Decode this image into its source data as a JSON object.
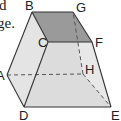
{
  "text_fragments": {
    "line1": "d",
    "line2": "ge."
  },
  "diagram": {
    "type": "solid-geometry",
    "colors": {
      "top_face": "#9a9a9a",
      "side_face_light": "#e6e6e6",
      "side_face_mid": "#dcdcdc",
      "edge": "#3a3a3a"
    },
    "vertices": {
      "A": {
        "label": "A",
        "x": 7,
        "y": 75
      },
      "B": {
        "label": "B",
        "x": 32,
        "y": 12
      },
      "C": {
        "label": "C",
        "x": 48,
        "y": 42
      },
      "D": {
        "label": "D",
        "x": 24,
        "y": 107
      },
      "E": {
        "label": "E",
        "x": 111,
        "y": 107
      },
      "F": {
        "label": "F",
        "x": 92,
        "y": 42
      },
      "G": {
        "label": "G",
        "x": 73,
        "y": 12
      },
      "H": {
        "label": "H",
        "x": 83,
        "y": 74
      }
    },
    "solid_edges": [
      "AB",
      "BG",
      "GF",
      "FC",
      "CB",
      "CD",
      "DA",
      "DE",
      "EF"
    ],
    "hidden_edges": [
      "AH",
      "HG",
      "HE"
    ]
  }
}
